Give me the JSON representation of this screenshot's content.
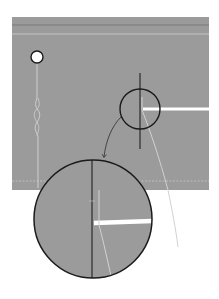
{
  "diagram": {
    "colors": {
      "background": "#ffffff",
      "panel": "#9b9b9b",
      "panel_top_line_dark": "#7a7a7a",
      "panel_top_line_light": "#c4c4c4",
      "outline": "#1a1a1a",
      "bright_line": "#ffffff",
      "thin_line": "#d2d2d2",
      "arrow": "#3a3a3a"
    },
    "elements": {
      "panel": {
        "x": 12,
        "y": 17,
        "width": 197,
        "height": 173
      },
      "marker_circle": {
        "cx": 37,
        "cy": 57,
        "r": 6
      },
      "small_callout": {
        "cx": 140,
        "cy": 109,
        "r": 20
      },
      "large_callout": {
        "cx": 93,
        "cy": 219,
        "r": 60
      },
      "callout_arrow": {
        "from": [
          120,
          118
        ],
        "to": [
          103,
          158
        ]
      }
    }
  }
}
